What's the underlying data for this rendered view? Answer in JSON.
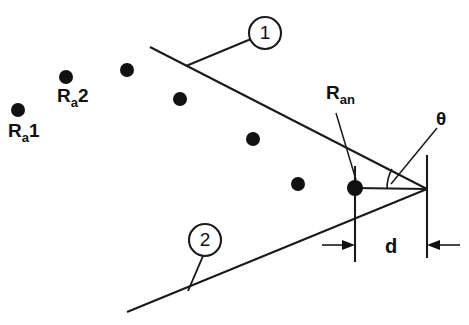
{
  "figure": {
    "background_color": "#ffffff",
    "line_color": "#1a1a1a",
    "dot_color": "#111111"
  },
  "labels": {
    "ra1": {
      "base": "R",
      "sub": "a",
      "index": "1",
      "full": "Ra1"
    },
    "ra2": {
      "base": "R",
      "sub": "a",
      "index": "2",
      "full": "Ra2"
    },
    "ran": {
      "base": "R",
      "sub": "an",
      "full": "Ran"
    },
    "theta": {
      "text": "θ"
    },
    "spacing": {
      "text": "d"
    }
  },
  "callouts": [
    {
      "id": "callout-1",
      "label": "1",
      "cx": 265,
      "cy": 33,
      "r": 16
    },
    {
      "id": "callout-2",
      "label": "2",
      "cx": 205,
      "cy": 240,
      "r": 16
    }
  ],
  "array_elements": [
    {
      "name": "Ra1",
      "cx": 18,
      "cy": 110,
      "r": 7
    },
    {
      "name": "Ra2",
      "cx": 66,
      "cy": 77,
      "r": 7
    },
    {
      "name": "element-3",
      "cx": 127,
      "cy": 70,
      "r": 7
    },
    {
      "name": "element-4",
      "cx": 180,
      "cy": 99,
      "r": 7
    },
    {
      "name": "element-5",
      "cx": 253,
      "cy": 139,
      "r": 7
    },
    {
      "name": "element-6",
      "cx": 298,
      "cy": 184,
      "r": 7
    },
    {
      "name": "Ran",
      "cx": 355,
      "cy": 188,
      "r": 8
    }
  ],
  "geometry": {
    "apex": {
      "x": 427,
      "y": 189
    },
    "ray_upper": {
      "x1": 150,
      "y1": 47,
      "x2": 427,
      "y2": 189
    },
    "ray_lower": {
      "x1": 127,
      "y1": 312,
      "x2": 427,
      "y2": 189
    },
    "baseline": {
      "x1": 355,
      "y1": 188,
      "x2": 427,
      "y2": 189
    },
    "extension_left": {
      "x": 355,
      "y1": 166,
      "y2": 262
    },
    "extension_right": {
      "x": 427,
      "y1": 155,
      "y2": 258
    },
    "angle_arc": {
      "cx": 427,
      "cy": 189,
      "r": 40
    },
    "dimension_d": {
      "y": 245,
      "left_x": 355,
      "right_x": 427
    }
  }
}
